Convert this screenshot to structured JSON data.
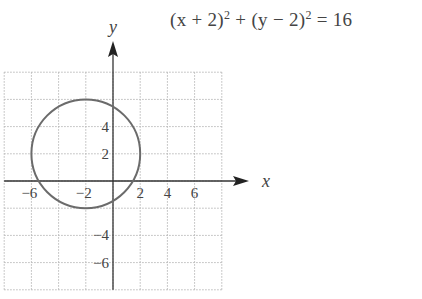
{
  "chart_data": {
    "type": "line",
    "equation": {
      "parts": [
        "(x + 2)",
        "2",
        " + (y − 2)",
        "2",
        " = 16"
      ]
    },
    "xlabel": "x",
    "ylabel": "y",
    "xlim": [
      -8,
      8
    ],
    "ylim": [
      -8,
      8
    ],
    "grid": true,
    "grid_range": {
      "x": [
        -8,
        8
      ],
      "y": [
        -8,
        8
      ],
      "step": 2
    },
    "xticks": [
      -6,
      -2,
      2,
      4,
      6
    ],
    "yticks": [
      4,
      2,
      -4,
      -6
    ],
    "series": [
      {
        "name": "circle",
        "shape": "circle",
        "center": [
          -2,
          2
        ],
        "radius": 4
      }
    ],
    "colors": {
      "curve": "#6b6b6b",
      "axis": "#333333",
      "grid": "#b8b8b8",
      "text": "#444444"
    }
  }
}
